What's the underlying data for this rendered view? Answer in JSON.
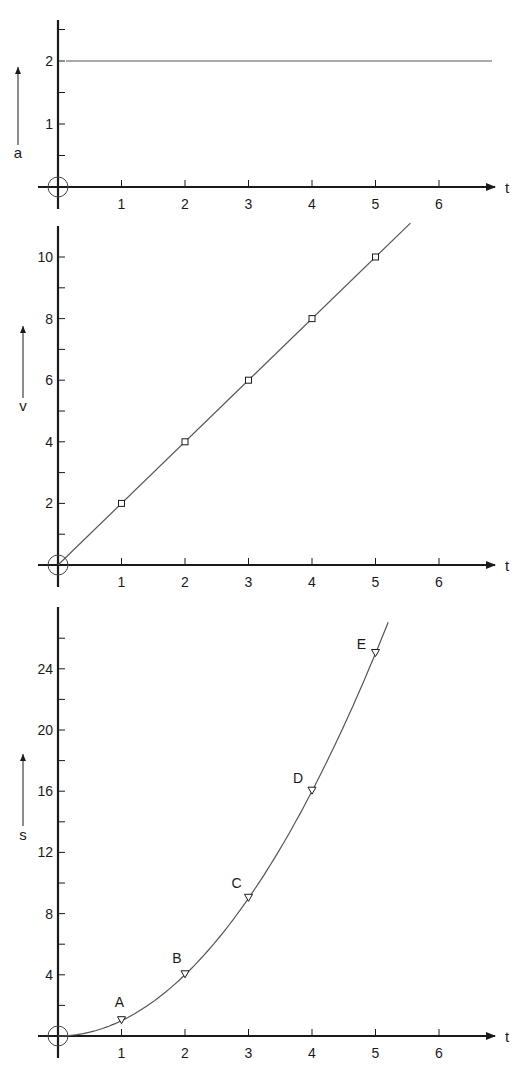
{
  "colors": {
    "ink": "#1a1a1a",
    "curve": "#555555",
    "background": "#ffffff"
  },
  "x_axis": {
    "label": "t",
    "ticks": [
      "1",
      "2",
      "3",
      "4",
      "5",
      "6"
    ]
  },
  "charts": [
    {
      "id": "acceleration",
      "y_label": "a",
      "y_ticks": [
        "1",
        "2"
      ]
    },
    {
      "id": "velocity",
      "y_label": "v",
      "y_ticks": [
        "2",
        "4",
        "6",
        "8",
        "10"
      ]
    },
    {
      "id": "displacement",
      "y_label": "s",
      "y_ticks": [
        "4",
        "8",
        "12",
        "16",
        "20",
        "24"
      ],
      "point_labels": [
        "A",
        "B",
        "C",
        "D",
        "E"
      ]
    }
  ],
  "chart_data": [
    {
      "type": "line",
      "title": "",
      "xlabel": "t",
      "ylabel": "a",
      "x": [
        0,
        1,
        2,
        3,
        4,
        5,
        6,
        6.8
      ],
      "series": [
        {
          "name": "a(t)",
          "values": [
            2,
            2,
            2,
            2,
            2,
            2,
            2,
            2
          ]
        }
      ],
      "xlim": [
        0,
        7
      ],
      "ylim": [
        0,
        2.5
      ],
      "x_ticks": [
        1,
        2,
        3,
        4,
        5,
        6
      ],
      "y_ticks": [
        1,
        2
      ],
      "y_minor_ticks": [
        0.5,
        1.5,
        2.5
      ],
      "grid": false,
      "legend": "none",
      "annotations": [
        "origin circle at (0,0)",
        "upward arrow beside y-label"
      ]
    },
    {
      "type": "line",
      "title": "",
      "xlabel": "t",
      "ylabel": "v",
      "x": [
        0,
        1,
        2,
        3,
        4,
        5,
        5.5
      ],
      "series": [
        {
          "name": "v(t)",
          "values": [
            0,
            2,
            4,
            6,
            8,
            10,
            11
          ],
          "markers": "square",
          "marked_points": [
            [
              1,
              2
            ],
            [
              2,
              4
            ],
            [
              3,
              6
            ],
            [
              4,
              8
            ],
            [
              5,
              10
            ]
          ]
        }
      ],
      "xlim": [
        0,
        7
      ],
      "ylim": [
        0,
        11
      ],
      "x_ticks": [
        1,
        2,
        3,
        4,
        5,
        6
      ],
      "y_ticks": [
        2,
        4,
        6,
        8,
        10
      ],
      "y_minor_ticks": [
        1,
        3,
        5,
        7,
        9
      ],
      "grid": false,
      "legend": "none",
      "annotations": [
        "origin circle at (0,0)",
        "upward arrow beside y-label"
      ]
    },
    {
      "type": "line",
      "title": "",
      "xlabel": "t",
      "ylabel": "s",
      "x": [
        0,
        1,
        2,
        3,
        4,
        5,
        5.2
      ],
      "series": [
        {
          "name": "s(t)",
          "values": [
            0,
            1,
            4,
            9,
            16,
            25,
            27.5
          ],
          "markers": "triangle-down",
          "marked_points": [
            {
              "label": "A",
              "t": 1,
              "s": 1
            },
            {
              "label": "B",
              "t": 2,
              "s": 4
            },
            {
              "label": "C",
              "t": 3,
              "s": 9
            },
            {
              "label": "D",
              "t": 4,
              "s": 16
            },
            {
              "label": "E",
              "t": 5,
              "s": 25
            }
          ]
        }
      ],
      "xlim": [
        0,
        7
      ],
      "ylim": [
        0,
        28
      ],
      "x_ticks": [
        1,
        2,
        3,
        4,
        5,
        6
      ],
      "y_ticks": [
        4,
        8,
        12,
        16,
        20,
        24
      ],
      "y_minor_ticks": [
        2,
        6,
        10,
        14,
        18,
        22,
        26
      ],
      "grid": false,
      "legend": "none",
      "annotations": [
        "origin circle at (0,0)",
        "upward arrow beside y-label"
      ]
    }
  ]
}
